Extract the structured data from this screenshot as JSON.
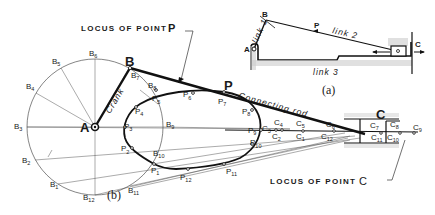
{
  "figure": {
    "caption_a": "(a)",
    "caption_b": "(b)",
    "locus_p_label": "LOCUS OF POINT",
    "locus_p_letter": "P",
    "locus_c_label": "LOCUS OF POINT",
    "locus_c_letter": "C",
    "crank_label": "Crank",
    "rod_label": "Connecting rod"
  },
  "inset_a": {
    "A": "A",
    "B": "B",
    "P": "P",
    "C": "C",
    "link1": "link 1",
    "link2": "link 2",
    "link3": "link 3"
  },
  "points_main": {
    "A": "A",
    "B": "B",
    "P": "P",
    "C": "C"
  },
  "b_points": [
    {
      "id": "B1",
      "base": "B",
      "sub": "1"
    },
    {
      "id": "B2",
      "base": "B",
      "sub": "2"
    },
    {
      "id": "B3",
      "base": "B",
      "sub": "3"
    },
    {
      "id": "B4",
      "base": "B",
      "sub": "4"
    },
    {
      "id": "B5",
      "base": "B",
      "sub": "5"
    },
    {
      "id": "B6",
      "base": "B",
      "sub": "6"
    },
    {
      "id": "B7",
      "base": "B",
      "sub": "7"
    },
    {
      "id": "B8",
      "base": "B",
      "sub": "8"
    },
    {
      "id": "B9",
      "base": "B",
      "sub": "9"
    },
    {
      "id": "B10",
      "base": "B",
      "sub": "10"
    },
    {
      "id": "B11",
      "base": "B",
      "sub": "11"
    },
    {
      "id": "B12",
      "base": "B",
      "sub": "12"
    }
  ],
  "p_points": [
    {
      "id": "P1",
      "base": "P",
      "sub": "1"
    },
    {
      "id": "P2",
      "base": "P",
      "sub": "2"
    },
    {
      "id": "P3",
      "base": "P",
      "sub": "3"
    },
    {
      "id": "P4",
      "base": "P",
      "sub": "4"
    },
    {
      "id": "P5",
      "base": "P",
      "sub": "5"
    },
    {
      "id": "P6",
      "base": "P",
      "sub": "6"
    },
    {
      "id": "P7",
      "base": "P",
      "sub": "7"
    },
    {
      "id": "P8",
      "base": "P",
      "sub": "8"
    },
    {
      "id": "P9",
      "base": "P",
      "sub": "9"
    },
    {
      "id": "P10",
      "base": "P",
      "sub": "10"
    },
    {
      "id": "P11",
      "base": "P",
      "sub": "11"
    },
    {
      "id": "P12",
      "base": "P",
      "sub": "12"
    }
  ],
  "c_points": [
    {
      "id": "C1",
      "base": "C",
      "sub": "1"
    },
    {
      "id": "C2",
      "base": "C",
      "sub": "2"
    },
    {
      "id": "C3",
      "base": "C",
      "sub": "3"
    },
    {
      "id": "C4",
      "base": "C",
      "sub": "4"
    },
    {
      "id": "C5",
      "base": "C",
      "sub": "5"
    },
    {
      "id": "C6",
      "base": "C",
      "sub": "6"
    },
    {
      "id": "C7",
      "base": "C",
      "sub": "7"
    },
    {
      "id": "C8",
      "base": "C",
      "sub": "8"
    },
    {
      "id": "C9",
      "base": "C",
      "sub": "9"
    },
    {
      "id": "C10",
      "base": "C",
      "sub": "10"
    },
    {
      "id": "C11",
      "base": "C",
      "sub": "11"
    },
    {
      "id": "C12",
      "base": "C",
      "sub": "12"
    }
  ]
}
